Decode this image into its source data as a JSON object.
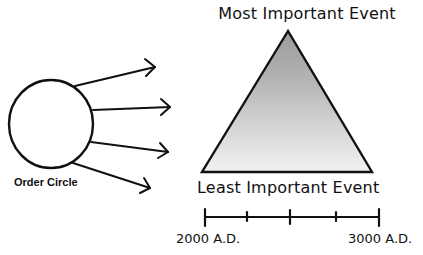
{
  "pyramid": {
    "top_label": "Most Important Event",
    "bottom_label": "Least Important Event",
    "gradient_top_color": "#9a9a9a",
    "gradient_bottom_color": "#f0f0f0"
  },
  "order_circle": {
    "label": "Order Circle",
    "arrow_count": 4
  },
  "timeline": {
    "start_label": "2000 A.D.",
    "end_label": "3000 A.D.",
    "tick_count": 5
  }
}
